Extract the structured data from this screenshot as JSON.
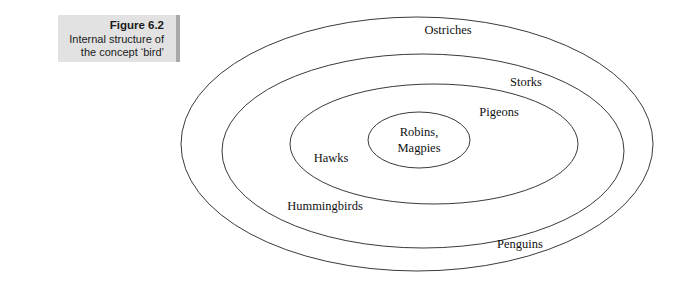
{
  "figure": {
    "caption": {
      "title": "Figure 6.2",
      "line1": "Internal structure of",
      "line2": "the concept ‘bird’"
    },
    "diagram": {
      "type": "concentric-ellipse-venn",
      "background_color": "#ffffff",
      "stroke_color": "#3a3a3a",
      "caption_bg_color": "#e2e2e2",
      "caption_accent_color": "#a8a8a8",
      "levels": [
        {
          "name": "outermost",
          "label": "Ostriches"
        },
        {
          "name": "fourth",
          "label": "Storks"
        },
        {
          "name": "fourth-b",
          "label": "Penguins"
        },
        {
          "name": "fourth-c",
          "label": "Hummingbirds"
        },
        {
          "name": "third",
          "label": "Pigeons"
        },
        {
          "name": "third-b",
          "label": "Hawks"
        },
        {
          "name": "core-line1",
          "label": "Robins,"
        },
        {
          "name": "core-line2",
          "label": "Magpies"
        }
      ]
    }
  },
  "labels": {
    "ostriches": "Ostriches",
    "storks": "Storks",
    "pigeons": "Pigeons",
    "hawks": "Hawks",
    "robins": "Robins,",
    "magpies": "Magpies",
    "hummingbirds": "Hummingbirds",
    "penguins": "Penguins"
  }
}
